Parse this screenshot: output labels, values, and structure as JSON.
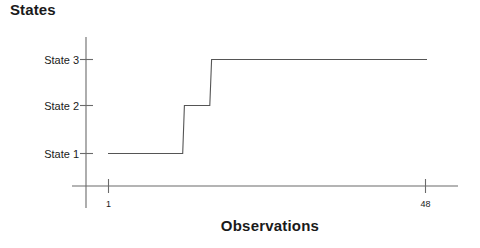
{
  "chart_data": {
    "type": "line",
    "title": "States",
    "subtitle": "",
    "xlabel": "Observations",
    "ylabel": "",
    "step": "post",
    "grid": false,
    "legend": null,
    "line_color": "#555555",
    "axis_color": "#6b6b6b",
    "background": "#ffffff",
    "xlim": [
      1,
      48
    ],
    "ylim": [
      1,
      3
    ],
    "x_tick_labels": [
      "1",
      "48"
    ],
    "x_ticks": [
      1,
      48
    ],
    "y_tick_labels": [
      "State 1",
      "State 2",
      "State 3"
    ],
    "y_ticks": [
      1,
      2,
      3
    ],
    "annotations": [],
    "x": [
      1,
      2,
      3,
      4,
      5,
      6,
      7,
      8,
      9,
      10,
      11,
      12,
      13,
      14,
      15,
      16,
      17,
      18,
      19,
      20,
      21,
      22,
      23,
      24,
      25,
      26,
      27,
      28,
      29,
      30,
      31,
      32,
      33,
      34,
      35,
      36,
      37,
      38,
      39,
      40,
      41,
      42,
      43,
      44,
      45,
      46,
      47,
      48
    ],
    "values": [
      1,
      1,
      1,
      1,
      1,
      1,
      1,
      1,
      1,
      1,
      1,
      1,
      2,
      2,
      2,
      2,
      3,
      3,
      3,
      3,
      3,
      3,
      3,
      3,
      3,
      3,
      3,
      3,
      3,
      3,
      3,
      3,
      3,
      3,
      3,
      3,
      3,
      3,
      3,
      3,
      3,
      3,
      3,
      3,
      3,
      3,
      3,
      3
    ],
    "segments": [
      {
        "state": 1,
        "state_label": "State 1",
        "x_start": 1,
        "x_end": 12
      },
      {
        "state": 2,
        "state_label": "State 2",
        "x_start": 13,
        "x_end": 16
      },
      {
        "state": 3,
        "state_label": "State 3",
        "x_start": 17,
        "x_end": 48
      }
    ]
  },
  "chart": {
    "title": "States",
    "xlabel": "Observations",
    "y_labels": [
      "State 3",
      "State 2",
      "State 1"
    ],
    "x_labels": [
      "1",
      "48"
    ]
  }
}
